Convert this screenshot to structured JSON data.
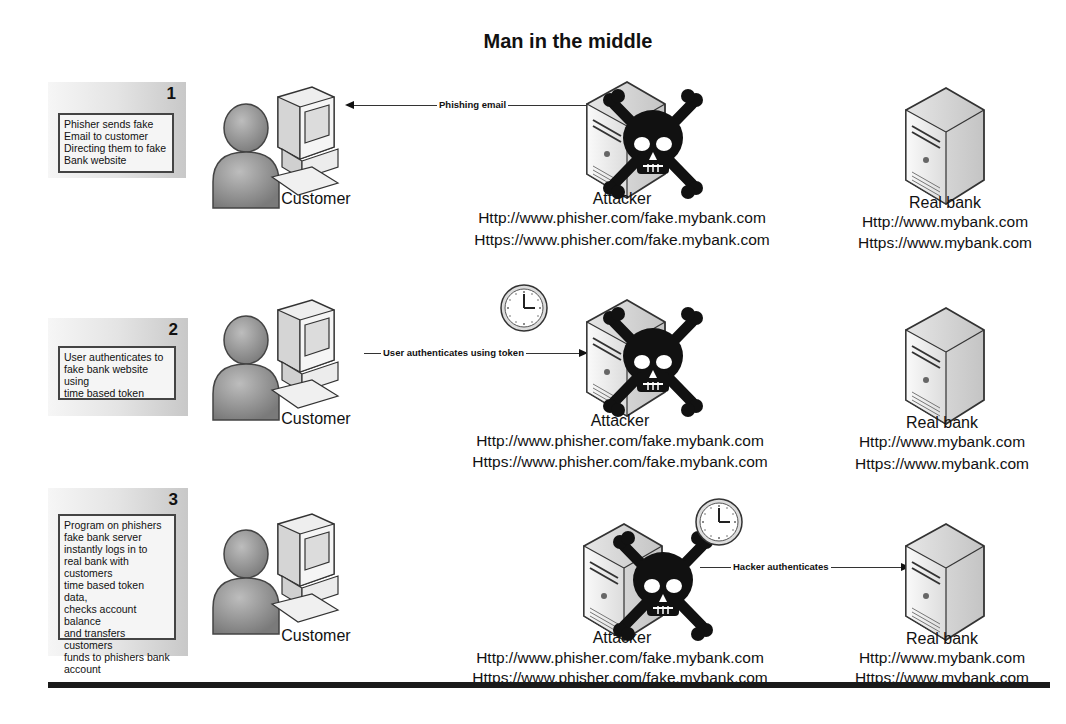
{
  "title": "Man in the middle",
  "rows": [
    {
      "step": "1",
      "description": [
        "Phisher sends fake",
        "Email to customer",
        "Directing them to fake",
        "Bank website"
      ],
      "connection": {
        "label": "Phishing email",
        "from": "attacker",
        "to": "customer"
      },
      "clock_near": null
    },
    {
      "step": "2",
      "description": [
        "User authenticates to",
        "fake bank website using",
        "time based token"
      ],
      "connection": {
        "label": "User authenticates using token",
        "from": "customer",
        "to": "attacker"
      },
      "clock_near": "customer-to-attacker"
    },
    {
      "step": "3",
      "description": [
        "Program on phishers",
        "fake bank server",
        "instantly logs in to",
        "real bank with customers",
        "time based token data,",
        "checks account balance",
        "and transfers customers",
        "funds to phishers bank",
        "account"
      ],
      "connection": {
        "label": "Hacker authenticates",
        "from": "attacker",
        "to": "real-bank"
      },
      "clock_near": "attacker-to-real-bank"
    }
  ],
  "nodes": {
    "customer": {
      "label": "Customer"
    },
    "attacker": {
      "label": "Attacker",
      "urls": [
        "Http://www.phisher.com/fake.mybank.com",
        "Https://www.phisher.com/fake.mybank.com"
      ]
    },
    "real_bank": {
      "label": "Real bank",
      "urls": [
        "Http://www.mybank.com",
        "Https://www.mybank.com"
      ]
    }
  },
  "text": {
    "r0": {
      "desc": "Phisher sends fake\nEmail to customer\nDirecting them to fake\nBank website"
    },
    "r1": {
      "desc": "User authenticates to\nfake bank website using\ntime based token"
    },
    "r2": {
      "desc": "Program on phishers\nfake bank server\ninstantly logs in to\nreal bank with customers\ntime based token data,\nchecks account balance\nand transfers customers\nfunds to phishers bank\naccount"
    }
  }
}
